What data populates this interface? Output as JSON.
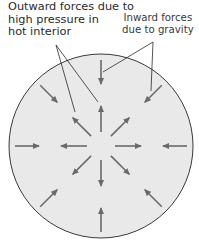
{
  "labels": {
    "outward": [
      "Outward forces due to",
      "high pressure in",
      "hot interior"
    ],
    "inward": [
      "Inward forces",
      "due to gravity"
    ]
  },
  "colors": {
    "circle_fill": "#e9e9e9",
    "circle_stroke": "#3a3a3a",
    "arrow": "#6a6a6a",
    "leader": "#2a2a2a"
  },
  "diagram": {
    "center": [
      101,
      146
    ],
    "radius": 92,
    "arrow_directions_deg": [
      0,
      45,
      90,
      135,
      180,
      225,
      270,
      315
    ]
  }
}
